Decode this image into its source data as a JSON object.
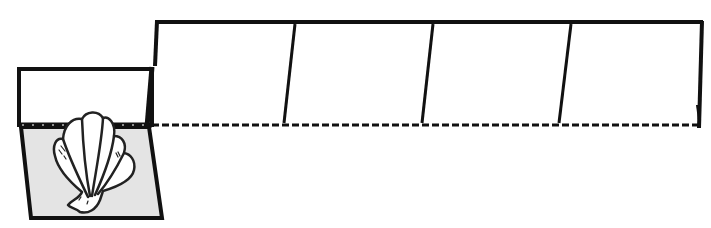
{
  "template": {
    "type": "paper-craft-net",
    "background": "#ffffff",
    "stroke_color": "#111111",
    "panel_fill": "#e4e4e4",
    "shell_fill": "#ffffff",
    "panels": [
      {
        "id": "lid-flap",
        "shape": "rectangle"
      },
      {
        "id": "shell-panel",
        "shape": "trapezoid",
        "illustration": "scallop-shell"
      },
      {
        "id": "strip-panel-1",
        "shape": "parallelogram"
      },
      {
        "id": "strip-panel-2",
        "shape": "parallelogram"
      },
      {
        "id": "strip-panel-3",
        "shape": "parallelogram"
      },
      {
        "id": "strip-panel-4",
        "shape": "parallelogram"
      }
    ],
    "fold_line": {
      "style": "dashed"
    },
    "icons": {
      "illustration": "scallop-shell-icon"
    }
  }
}
